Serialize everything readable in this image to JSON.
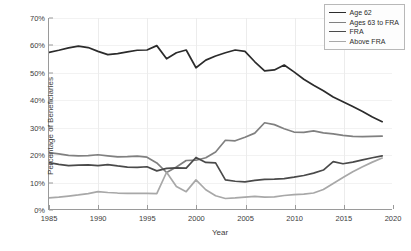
{
  "chart_data": {
    "type": "line",
    "title": "",
    "xlabel": "Year",
    "ylabel": "Percentage of Beneficiaries",
    "xlim": [
      1985,
      2020
    ],
    "ylim": [
      0,
      70
    ],
    "xticks": [
      1985,
      1990,
      1995,
      2000,
      2005,
      2010,
      2015,
      2020
    ],
    "xtick_labels": [
      "1985",
      "1990",
      "1995",
      "2000",
      "2005",
      "2010",
      "2015",
      "2020"
    ],
    "yticks": [
      0,
      10,
      20,
      30,
      40,
      50,
      60,
      70
    ],
    "ytick_labels": [
      "0%",
      "10%",
      "20%",
      "30%",
      "40%",
      "50%",
      "60%",
      "70%"
    ],
    "grid": true,
    "legend_position": "top-right",
    "x": [
      1985,
      1986,
      1987,
      1988,
      1989,
      1990,
      1991,
      1992,
      1993,
      1994,
      1995,
      1996,
      1997,
      1998,
      1999,
      2000,
      2001,
      2002,
      2003,
      2004,
      2005,
      2006,
      2007,
      2008,
      2009,
      2010,
      2011,
      2012,
      2013,
      2014,
      2015,
      2016,
      2017,
      2018,
      2019
    ],
    "series": [
      {
        "name": "Age 62",
        "color": "#2b2b2b",
        "values": [
          57.4,
          58.2,
          59.1,
          59.7,
          59.2,
          57.8,
          56.6,
          57.0,
          57.6,
          58.2,
          58.3,
          59.9,
          55.1,
          57.3,
          58.3,
          51.8,
          54.6,
          56.1,
          57.3,
          58.3,
          57.8,
          54.0,
          50.7,
          51.0,
          52.8,
          50.3,
          47.6,
          45.4,
          43.4,
          41.1,
          39.4,
          37.6,
          35.8,
          33.8,
          32.1
        ]
      },
      {
        "name": "Ages 63 to FRA",
        "color": "#808080",
        "values": [
          20.8,
          20.3,
          19.8,
          19.6,
          19.7,
          20.0,
          19.6,
          19.2,
          19.3,
          19.5,
          19.1,
          17.0,
          13.5,
          15.5,
          17.9,
          18.0,
          18.9,
          21.0,
          25.3,
          25.1,
          26.4,
          27.9,
          31.7,
          31.0,
          29.5,
          28.3,
          28.2,
          28.7,
          28.0,
          27.6,
          27.1,
          26.7,
          26.6,
          26.7,
          26.8
        ]
      },
      {
        "name": "FRA",
        "color": "#4a4a4a",
        "values": [
          17.1,
          16.5,
          16.0,
          16.2,
          16.3,
          16.0,
          16.4,
          15.9,
          15.5,
          15.4,
          15.6,
          14.1,
          15.0,
          15.2,
          15.1,
          19.0,
          17.2,
          17.0,
          10.8,
          10.3,
          10.1,
          10.6,
          11.0,
          11.1,
          11.3,
          11.8,
          12.4,
          13.3,
          14.4,
          17.5,
          16.7,
          17.3,
          18.1,
          18.9,
          19.6
        ]
      },
      {
        "name": "Above FRA",
        "color": "#a8a8a8",
        "values": [
          4.2,
          4.5,
          4.9,
          5.3,
          5.8,
          6.5,
          6.2,
          6.0,
          5.9,
          5.9,
          5.9,
          5.8,
          13.6,
          8.4,
          6.5,
          10.8,
          7.2,
          5.0,
          4.0,
          4.2,
          4.5,
          4.8,
          4.5,
          4.6,
          5.1,
          5.4,
          5.6,
          6.0,
          7.3,
          9.5,
          11.7,
          13.8,
          15.6,
          17.3,
          18.8
        ]
      }
    ]
  },
  "legend": {
    "entries": [
      "Age 62",
      "Ages 63 to FRA",
      "FRA",
      "Above FRA"
    ]
  }
}
